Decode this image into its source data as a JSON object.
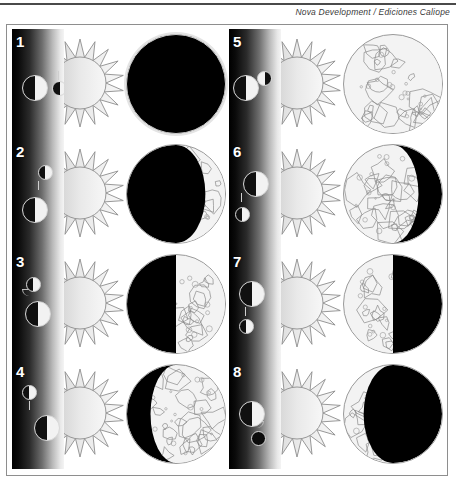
{
  "header": {
    "credit": "Nova Development / Ediciones Caliope"
  },
  "figure": {
    "panels": [
      {
        "number": "1",
        "phase_name": "New Moon",
        "illuminated_percent": 0,
        "lit_side": "none",
        "earth_lit": "right",
        "moon_lit": "right",
        "moon_position": "right-of-earth",
        "disc_style": "new"
      },
      {
        "number": "2",
        "phase_name": "Waxing Crescent",
        "illuminated_percent": 25,
        "lit_side": "right",
        "earth_lit": "right",
        "moon_lit": "right",
        "moon_position": "above-right-of-earth",
        "disc_style": "crescent-right"
      },
      {
        "number": "3",
        "phase_name": "First Quarter",
        "illuminated_percent": 50,
        "lit_side": "right",
        "earth_lit": "right",
        "moon_lit": "right",
        "moon_position": "above-earth",
        "disc_style": "half-right"
      },
      {
        "number": "4",
        "phase_name": "Waxing Gibbous",
        "illuminated_percent": 75,
        "lit_side": "right",
        "earth_lit": "right",
        "moon_lit": "right",
        "moon_position": "below-right-of-earth",
        "disc_style": "gibbous-right"
      },
      {
        "number": "5",
        "phase_name": "Full Moon",
        "illuminated_percent": 100,
        "lit_side": "full",
        "earth_lit": "right",
        "moon_lit": "left",
        "moon_position": "right-of-earth",
        "disc_style": "full"
      },
      {
        "number": "6",
        "phase_name": "Waning Gibbous",
        "illuminated_percent": 75,
        "lit_side": "left",
        "earth_lit": "right",
        "moon_lit": "right",
        "moon_position": "below-left-of-earth",
        "disc_style": "gibbous-left"
      },
      {
        "number": "7",
        "phase_name": "Last Quarter",
        "illuminated_percent": 50,
        "lit_side": "left",
        "earth_lit": "right",
        "moon_lit": "right",
        "moon_position": "below-earth",
        "disc_style": "half-left"
      },
      {
        "number": "8",
        "phase_name": "Waning Crescent",
        "illuminated_percent": 25,
        "lit_side": "left",
        "earth_lit": "right",
        "moon_lit": "dark",
        "moon_position": "below-right-of-earth",
        "disc_style": "crescent-left"
      }
    ]
  },
  "colors": {
    "border": "#8e8e8e",
    "rule": "#4a4a4a",
    "shadow": "#000000",
    "lit": "#f2f2f2",
    "page": "#ffffff"
  }
}
